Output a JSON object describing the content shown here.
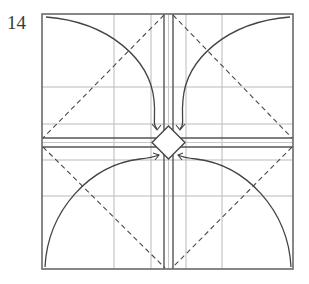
{
  "step": {
    "number": "14"
  },
  "diagram": {
    "type": "origami-fold-diagram",
    "colors": {
      "line": "#444444",
      "grid": "#b9b9b9",
      "background": "#ffffff"
    },
    "frame": {
      "x": 42,
      "y": 14,
      "width": 251,
      "height": 255
    },
    "vertical_grid_x": [
      114,
      151,
      186,
      222
    ],
    "horizontal_grid_y": [
      87,
      124,
      160,
      196
    ],
    "vertical_band": {
      "x1": 164,
      "x2": 173,
      "mid": 168.5
    },
    "horizontal_band": {
      "y1": 138,
      "y2": 147,
      "mid": 142.5
    },
    "center_diamond": {
      "cx": 168.5,
      "cy": 142.5,
      "r": 17
    },
    "arrows": [
      {
        "name": "top-left",
        "direction": "toward-center"
      },
      {
        "name": "top-right",
        "direction": "toward-center"
      },
      {
        "name": "bottom-left",
        "direction": "toward-center"
      },
      {
        "name": "bottom-right",
        "direction": "toward-center"
      }
    ]
  }
}
